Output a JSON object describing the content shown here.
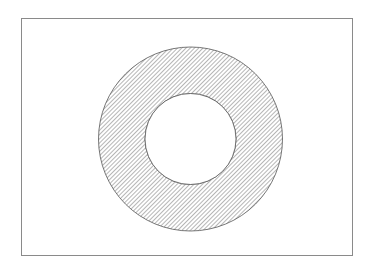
{
  "figure": {
    "frame": {
      "x": 21,
      "y": 18,
      "width": 331,
      "height": 237,
      "stroke": "#8a8a8a"
    },
    "annulus": {
      "cx": 190.5,
      "cy": 139,
      "outer_r": 92,
      "inner_r": 45.5,
      "stroke": "#555555",
      "hatch_color": "#6e6e6e",
      "hatch_spacing": 3
    }
  }
}
